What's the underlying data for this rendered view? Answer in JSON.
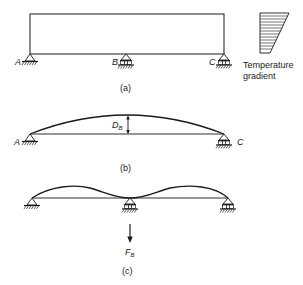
{
  "figure_a": {
    "caption": "(a)",
    "support_labels": {
      "a": "A",
      "b": "B",
      "c": "C"
    },
    "gradient_label_line1": "Temperature",
    "gradient_label_line2": "gradient"
  },
  "figure_b": {
    "caption": "(b)",
    "support_labels": {
      "a": "A",
      "c": "C"
    },
    "deflection_label": "D",
    "deflection_subscript": "B"
  },
  "figure_c": {
    "caption": "(c)",
    "force_label": "F",
    "force_subscript": "B"
  },
  "colors": {
    "ink": "#1a1a1a",
    "background": "#ffffff"
  }
}
